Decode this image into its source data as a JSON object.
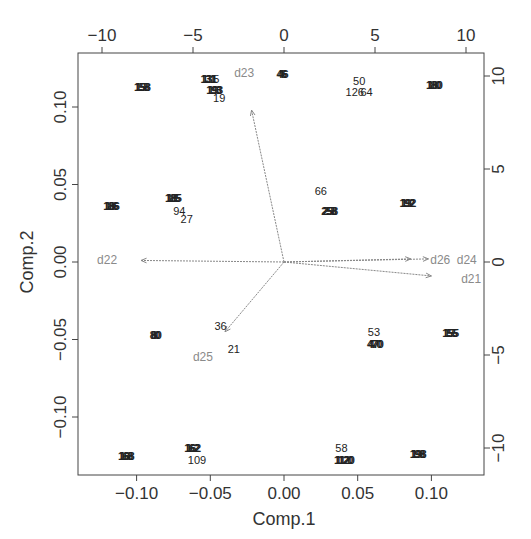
{
  "chart_data": {
    "type": "scatter",
    "subtype": "biplot",
    "title": "",
    "xlabel": "Comp.1",
    "ylabel": "Comp.2",
    "xlim": [
      -0.14,
      0.135
    ],
    "ylim": [
      -0.137,
      0.135
    ],
    "grid": false,
    "legend": null,
    "bottom_ticks": [
      "-0.10",
      "-0.05",
      "0.00",
      "0.05",
      "0.10"
    ],
    "left_ticks": [
      "-0.10",
      "-0.05",
      "0.00",
      "0.05",
      "0.10"
    ],
    "top_ticks": [
      "-10",
      "-5",
      "0",
      "5",
      "10"
    ],
    "right_ticks": [
      "-10",
      "-5",
      "0",
      "5",
      "10"
    ],
    "secondary_axis_range": [
      -10,
      10
    ],
    "points": [
      {
        "label": "158",
        "x": -0.097,
        "y": 0.113,
        "overlap": true
      },
      {
        "label": "131",
        "x": -0.052,
        "y": 0.118,
        "overlap": true
      },
      {
        "label": "5",
        "x": -0.046,
        "y": 0.118
      },
      {
        "label": "46",
        "x": -0.002,
        "y": 0.121,
        "overlap": true
      },
      {
        "label": "193",
        "x": -0.048,
        "y": 0.111,
        "overlap": true
      },
      {
        "label": "19",
        "x": -0.044,
        "y": 0.106
      },
      {
        "label": "50",
        "x": 0.051,
        "y": 0.117
      },
      {
        "label": "126",
        "x": 0.048,
        "y": 0.11
      },
      {
        "label": "64",
        "x": 0.056,
        "y": 0.11
      },
      {
        "label": "180",
        "x": 0.101,
        "y": 0.114,
        "overlap": true
      },
      {
        "label": "186",
        "x": -0.118,
        "y": 0.036,
        "overlap": true
      },
      {
        "label": "185",
        "x": -0.076,
        "y": 0.041,
        "overlap": true
      },
      {
        "label": "94",
        "x": -0.071,
        "y": 0.033
      },
      {
        "label": "27",
        "x": -0.066,
        "y": 0.028
      },
      {
        "label": "66",
        "x": 0.025,
        "y": 0.046
      },
      {
        "label": "258",
        "x": 0.03,
        "y": 0.033,
        "overlap": true
      },
      {
        "label": "192",
        "x": 0.083,
        "y": 0.038,
        "overlap": true
      },
      {
        "label": "80",
        "x": -0.088,
        "y": -0.047,
        "overlap": true
      },
      {
        "label": "36",
        "x": -0.043,
        "y": -0.041
      },
      {
        "label": "21",
        "x": -0.034,
        "y": -0.056
      },
      {
        "label": "53",
        "x": 0.061,
        "y": -0.045
      },
      {
        "label": "470",
        "x": 0.061,
        "y": -0.053,
        "overlap": true
      },
      {
        "label": "155",
        "x": 0.112,
        "y": -0.046,
        "overlap": true
      },
      {
        "label": "168",
        "x": -0.108,
        "y": -0.125,
        "overlap": true
      },
      {
        "label": "162",
        "x": -0.063,
        "y": -0.12,
        "overlap": true
      },
      {
        "label": "109",
        "x": -0.059,
        "y": -0.128
      },
      {
        "label": "58",
        "x": 0.039,
        "y": -0.12
      },
      {
        "label": "1120",
        "x": 0.04,
        "y": -0.128,
        "overlap": true
      },
      {
        "label": "198",
        "x": 0.09,
        "y": -0.124,
        "overlap": true
      }
    ],
    "loadings": [
      {
        "name": "d21",
        "x": 0.1,
        "y": -0.009,
        "label_x": 0.127,
        "label_y": -0.011
      },
      {
        "name": "d22",
        "x": -0.097,
        "y": 0.001,
        "label_x": -0.12,
        "label_y": 0.001
      },
      {
        "name": "d23",
        "x": -0.022,
        "y": 0.098,
        "label_x": -0.027,
        "label_y": 0.122
      },
      {
        "name": "d24",
        "x": 0.098,
        "y": 0.002,
        "label_x": 0.124,
        "label_y": 0.001
      },
      {
        "name": "d25",
        "x": -0.04,
        "y": -0.045,
        "label_x": -0.055,
        "label_y": -0.061
      },
      {
        "name": "d26",
        "x": 0.086,
        "y": 0.002,
        "label_x": 0.106,
        "label_y": 0.001
      }
    ]
  },
  "layout": {
    "frame": {
      "left": 78,
      "top": 53,
      "right": 484,
      "bottom": 475
    },
    "x_origin_px": 284,
    "x_px_per_unit": 1474,
    "y_origin_px": 262,
    "y_px_per_unit": 1550,
    "colors": {
      "points": "#222222",
      "arrows": "#888888",
      "var_labels": "#8a8a8a",
      "axis": "#444444"
    }
  }
}
